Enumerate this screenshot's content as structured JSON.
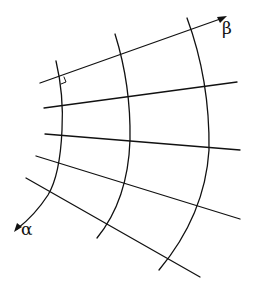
{
  "diagram": {
    "stroke_color": "#111111",
    "background": "#ffffff",
    "axes": {
      "alpha": {
        "label": "α",
        "direction": "down-left along curved coordinate line"
      },
      "beta": {
        "label": "β",
        "direction": "up-right along straight coordinate line"
      }
    },
    "beta_lines": [
      {
        "id": 1,
        "from": [
          40,
          83
        ],
        "to": [
          225,
          17
        ],
        "arrow": true
      },
      {
        "id": 2,
        "from": [
          44,
          108
        ],
        "to": [
          237,
          82
        ],
        "arrow": false
      },
      {
        "id": 3,
        "from": [
          45,
          134
        ],
        "to": [
          240,
          150
        ],
        "arrow": false
      },
      {
        "id": 4,
        "from": [
          36,
          156
        ],
        "to": [
          240,
          219
        ],
        "arrow": false
      },
      {
        "id": 5,
        "from": [
          26,
          178
        ],
        "to": [
          200,
          277
        ],
        "arrow": false
      }
    ],
    "alpha_curves": [
      {
        "id": 1,
        "arrow": true
      },
      {
        "id": 2,
        "arrow": false
      },
      {
        "id": 3,
        "arrow": false
      }
    ],
    "right_angle_marker": {
      "at": "intersection of beta line 1 and alpha curve 1"
    }
  }
}
